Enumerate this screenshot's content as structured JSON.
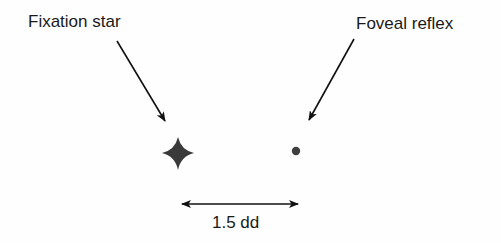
{
  "labels": {
    "fixation_star": "Fixation star",
    "foveal_reflex": "Foveal reflex",
    "distance": "1.5 dd"
  },
  "icons": {
    "star": "four-point-star",
    "dot": "filled-circle"
  },
  "colors": {
    "text": "#1a1a1a",
    "star": "#3a3a3a",
    "dot": "#3f3f3f",
    "arrow": "#111111",
    "background": "#fefefe"
  }
}
